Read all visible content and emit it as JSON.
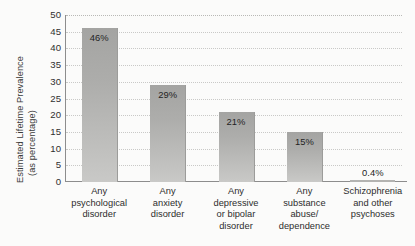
{
  "chart_data": {
    "type": "bar",
    "title": "",
    "subtitle": "",
    "xlabel": "",
    "ylabel": "Estimated Lifetime Prevalence (as percentage)",
    "ylabel_lines": [
      "Estimated Lifetime Prevalence",
      "(as percentage)"
    ],
    "ylim": [
      0,
      50
    ],
    "ytick_step": 5,
    "yticks": [
      50,
      45,
      40,
      35,
      30,
      25,
      20,
      15,
      10,
      5,
      0
    ],
    "ytick_labels": [
      "50",
      "45",
      "40",
      "35",
      "30",
      "25",
      "20",
      "15",
      "10",
      "5",
      "0"
    ],
    "grid": true,
    "grid_style": "dotted",
    "legend": false,
    "legend_position": "none",
    "categories": [
      "Any psychological disorder",
      "Any anxiety disorder",
      "Any depressive or bipolar disorder",
      "Any substance abuse/dependence",
      "Schizophrenia and other psychoses"
    ],
    "category_lines": [
      [
        "Any",
        "psychological",
        "disorder"
      ],
      [
        "Any",
        "anxiety",
        "disorder"
      ],
      [
        "Any",
        "depressive",
        "or bipolar",
        "disorder"
      ],
      [
        "Any",
        "substance",
        "abuse/",
        "dependence"
      ],
      [
        "Schizophrenia",
        "and other",
        "psychoses"
      ]
    ],
    "values": [
      46,
      29,
      21,
      15,
      0.4
    ],
    "value_labels": [
      "46%",
      "29%",
      "21%",
      "15%",
      "0.4%"
    ],
    "label_placement": [
      "inside",
      "inside",
      "inside",
      "inside",
      "outside"
    ],
    "colors": {
      "bar_fill_top": "#a4a4a2",
      "bar_fill_bottom": "#c9c9c7",
      "bar_edge": "#9c9c9a",
      "gridline": "#b9b9b6",
      "axis": "#8d8d8d",
      "text": "#2d2d2d",
      "background": "#fbfbfa"
    }
  }
}
